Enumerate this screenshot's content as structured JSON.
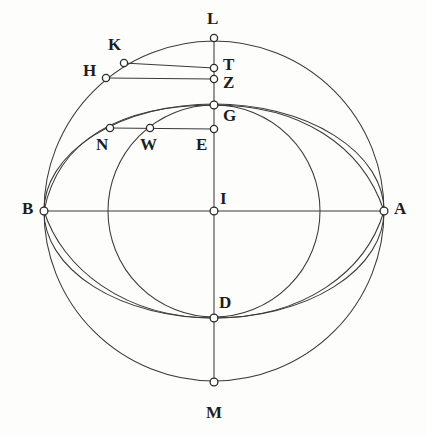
{
  "figure": {
    "canvas": {
      "width": 427,
      "height": 436
    },
    "colors": {
      "background": "#fdfdfc",
      "stroke": "#3a3a3a",
      "node_fill": "#ffffff",
      "node_stroke": "#2b2b2b",
      "label": "#1d1d1d"
    }
  },
  "geometry": {
    "center": {
      "name": "I",
      "x": 214,
      "y": 211
    },
    "outer_circle": {
      "cx": 214,
      "cy": 211,
      "r": 170
    },
    "main_ellipse": {
      "cx": 214,
      "cy": 211,
      "rx": 170,
      "ry": 107
    },
    "inner_circle": {
      "cx": 214,
      "cy": 211,
      "r": 106
    },
    "horizontal_axis": {
      "x1": 44,
      "y1": 211,
      "x2": 384,
      "y2": 211
    },
    "vertical_axis": {
      "x1": 214,
      "y1": 38,
      "x2": 214,
      "y2": 382
    }
  },
  "points": [
    {
      "id": "L",
      "label": "L",
      "x": 214,
      "y": 38,
      "label_x": 207,
      "label_y": 10,
      "on": "outer-circle-top"
    },
    {
      "id": "K",
      "label": "K",
      "x": 124,
      "y": 63,
      "label_x": 108,
      "label_y": 36,
      "on": "outer-circle"
    },
    {
      "id": "T",
      "label": "T",
      "x": 214,
      "y": 68,
      "label_x": 223,
      "label_y": 56,
      "on": "vertical-axis"
    },
    {
      "id": "H",
      "label": "H",
      "x": 106,
      "y": 78,
      "label_x": 83,
      "label_y": 62,
      "on": "outer-circle"
    },
    {
      "id": "Z",
      "label": "Z",
      "x": 214,
      "y": 79,
      "label_x": 223,
      "label_y": 74,
      "on": "vertical-axis"
    },
    {
      "id": "G",
      "label": "G",
      "x": 214,
      "y": 105,
      "label_x": 223,
      "label_y": 107,
      "on": "ellipse-top"
    },
    {
      "id": "N",
      "label": "N",
      "x": 110,
      "y": 128,
      "label_x": 96,
      "label_y": 136,
      "on": "ellipse"
    },
    {
      "id": "W",
      "label": "W",
      "x": 150,
      "y": 128,
      "label_x": 140,
      "label_y": 136,
      "on": "inner-circle"
    },
    {
      "id": "E",
      "label": "E",
      "x": 214,
      "y": 129,
      "label_x": 196,
      "label_y": 136,
      "on": "vertical-axis"
    },
    {
      "id": "B",
      "label": "B",
      "x": 44,
      "y": 211,
      "label_x": 22,
      "label_y": 200,
      "on": "horizontal-axis-left"
    },
    {
      "id": "I",
      "label": "I",
      "x": 214,
      "y": 211,
      "label_x": 220,
      "label_y": 190,
      "on": "center"
    },
    {
      "id": "A",
      "label": "A",
      "x": 384,
      "y": 211,
      "label_x": 394,
      "label_y": 200,
      "on": "horizontal-axis-right"
    },
    {
      "id": "D",
      "label": "D",
      "x": 214,
      "y": 318,
      "label_x": 219,
      "label_y": 294,
      "on": "ellipse-bottom"
    },
    {
      "id": "M",
      "label": "M",
      "x": 214,
      "y": 382,
      "label_x": 206,
      "label_y": 404,
      "on": "outer-circle-bottom"
    }
  ],
  "chords": [
    {
      "id": "KT",
      "from": "K",
      "to": "T",
      "x1": 124,
      "y1": 63,
      "x2": 214,
      "y2": 68
    },
    {
      "id": "HZ",
      "from": "H",
      "to": "Z",
      "x1": 106,
      "y1": 78,
      "x2": 214,
      "y2": 79
    },
    {
      "id": "NE",
      "from": "N",
      "to": "E",
      "x1": 110,
      "y1": 128,
      "x2": 214,
      "y2": 129
    }
  ],
  "curves": [
    {
      "id": "outer-circle",
      "kind": "circle",
      "description": "Great circle through B, L, A, M"
    },
    {
      "id": "main-ellipse",
      "kind": "ellipse",
      "description": "Ellipse through B, G, A, D"
    },
    {
      "id": "inner-circle",
      "kind": "circle",
      "description": "Inner circle through G, W, D"
    },
    {
      "id": "oblique-arc-upper",
      "kind": "arc",
      "description": "Oblique arc from B through G to A"
    },
    {
      "id": "oblique-arc-lower",
      "kind": "arc",
      "description": "Oblique arc from B through D to A"
    }
  ]
}
